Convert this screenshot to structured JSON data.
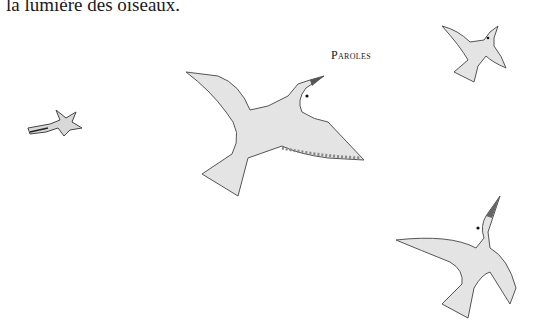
{
  "page": {
    "text_line": "la lumière des oiseaux.",
    "running_header": "Paroles"
  },
  "illustrations": [
    {
      "name": "small-bird-left",
      "description": "small bird flying left"
    },
    {
      "name": "large-gull-center",
      "description": "large white gull gliding"
    },
    {
      "name": "bird-top-right",
      "description": "small white bird flying up-right"
    },
    {
      "name": "bird-bottom-right",
      "description": "white bird flying upward"
    }
  ],
  "colors": {
    "text": "#1a1a1a",
    "bird_fill": "#e4e4e4",
    "bird_stroke": "#555555",
    "background": "#ffffff"
  }
}
